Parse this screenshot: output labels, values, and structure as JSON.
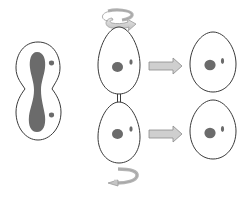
{
  "diagram": {
    "title": "Asymmetric cell division with cell rotation",
    "colors": {
      "background": "#ffffff",
      "outline": "#3a3a3a",
      "nucleus": "#6b6b6b",
      "arrow_fill": "#cfcfcf",
      "arrow_stroke": "#8a8a8a"
    },
    "elements": {
      "dividing_cell": "dividing-cell-with-elongated-nucleus",
      "daughter_top": "daughter-cell-top",
      "daughter_bottom": "daughter-cell-bottom",
      "rotation_top": "clockwise-rotation-arrow",
      "rotation_bottom": "counterclockwise-rotation-arrow",
      "result_top": "separated-cell-top",
      "result_bottom": "separated-cell-bottom",
      "arrow_top": "right-arrow",
      "arrow_bottom": "right-arrow"
    }
  }
}
